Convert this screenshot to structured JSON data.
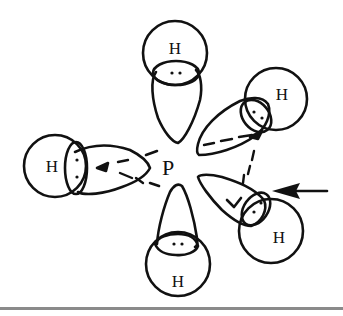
{
  "diagram": {
    "central_atom": {
      "label": "P"
    },
    "ligands": [
      {
        "id": "top",
        "label": "H",
        "position": "axial-top"
      },
      {
        "id": "upper-right",
        "label": "H",
        "position": "equatorial-back"
      },
      {
        "id": "lower-right",
        "label": "H",
        "position": "equatorial-front"
      },
      {
        "id": "left",
        "label": "H",
        "position": "equatorial-left"
      },
      {
        "id": "bottom",
        "label": "H",
        "position": "axial-bottom"
      }
    ],
    "annotations": [
      {
        "type": "arrow",
        "points_to": "lower-right",
        "direction": "left"
      }
    ],
    "colors": {
      "ink": "#111111",
      "background": "#ffffff"
    }
  }
}
